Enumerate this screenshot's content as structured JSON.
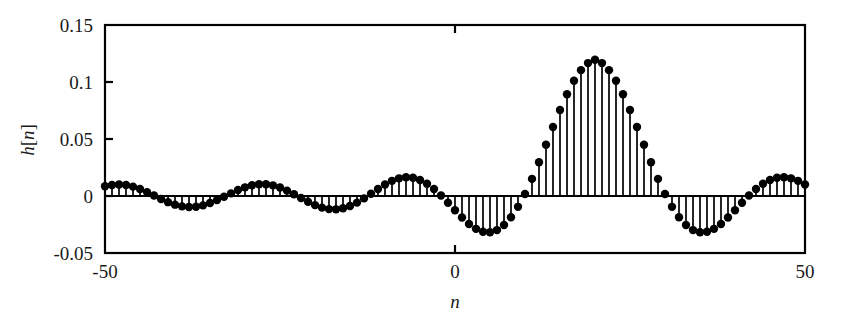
{
  "chart_data": {
    "type": "line",
    "plot_style": "stem",
    "title": "",
    "subtitle": "",
    "xlabel": "n",
    "ylabel": "h[n]",
    "xlim": [
      -50,
      50
    ],
    "ylim": [
      -0.05,
      0.15
    ],
    "xticks": [
      -50,
      0,
      50
    ],
    "xticklabels": [
      "-50",
      "0",
      "50"
    ],
    "yticks": [
      -0.05,
      0,
      0.05,
      0.1,
      0.15
    ],
    "yticklabels": [
      "-0.05",
      "0",
      "0.05",
      "0.1",
      "0.15"
    ],
    "grid": false,
    "legend": false,
    "legend_position": "none",
    "marker": "filled-circle",
    "marker_color": "#000000",
    "stem_color": "#000000",
    "baseline_value": 0,
    "annotations": [],
    "x": [
      -50,
      -49,
      -48,
      -47,
      -46,
      -45,
      -44,
      -43,
      -42,
      -41,
      -40,
      -39,
      -38,
      -37,
      -36,
      -35,
      -34,
      -33,
      -32,
      -31,
      -30,
      -29,
      -28,
      -27,
      -26,
      -25,
      -24,
      -23,
      -22,
      -21,
      -20,
      -19,
      -18,
      -17,
      -16,
      -15,
      -14,
      -13,
      -12,
      -11,
      -10,
      -9,
      -8,
      -7,
      -6,
      -5,
      -4,
      -3,
      -2,
      -1,
      0,
      1,
      2,
      3,
      4,
      5,
      6,
      7,
      8,
      9,
      10,
      11,
      12,
      13,
      14,
      15,
      16,
      17,
      18,
      19,
      20,
      21,
      22,
      23,
      24,
      25,
      26,
      27,
      28,
      29,
      30,
      31,
      32,
      33,
      34,
      35,
      36,
      37,
      38,
      39,
      40,
      41,
      42,
      43,
      44,
      45,
      46,
      47,
      48,
      49,
      50
    ],
    "values": [
      0.0085,
      0.0097,
      0.0101,
      0.0096,
      0.0082,
      0.0061,
      0.0034,
      0.0004,
      -0.0026,
      -0.0054,
      -0.0076,
      -0.0091,
      -0.0097,
      -0.0094,
      -0.0082,
      -0.0062,
      -0.0036,
      -0.0007,
      0.0023,
      0.0052,
      0.0076,
      0.0094,
      0.0103,
      0.0103,
      0.0093,
      0.0074,
      0.0047,
      0.0016,
      -0.0018,
      -0.0051,
      -0.008,
      -0.0102,
      -0.0115,
      -0.0117,
      -0.0108,
      -0.0088,
      -0.0058,
      -0.0021,
      0.002,
      0.0062,
      0.0101,
      0.0133,
      0.0155,
      0.0164,
      0.016,
      0.0141,
      0.0108,
      0.0062,
      0.0005,
      -0.0059,
      -0.0125,
      -0.0189,
      -0.0245,
      -0.0288,
      -0.0313,
      -0.0318,
      -0.0299,
      -0.0255,
      -0.0187,
      -0.0095,
      0.0018,
      0.015,
      0.0296,
      0.045,
      0.0605,
      0.0755,
      0.0893,
      0.1011,
      0.1104,
      0.1166,
      0.1195,
      0.1166,
      0.1104,
      0.1011,
      0.0893,
      0.0755,
      0.0605,
      0.045,
      0.0296,
      0.015,
      0.0018,
      -0.0095,
      -0.0187,
      -0.0255,
      -0.0299,
      -0.0318,
      -0.0313,
      -0.0288,
      -0.0245,
      -0.0189,
      -0.0125,
      -0.0059,
      0.0005,
      0.0062,
      0.0108,
      0.0141,
      0.016,
      0.0164,
      0.0155,
      0.0133,
      0.0101
    ],
    "peak_value": 0.13,
    "peak_x": 0,
    "min_value": -0.0265,
    "n_points": 101
  },
  "axes": {
    "y_label_text": "h",
    "y_label_bracket": "[",
    "y_label_index": "n",
    "y_label_bracket_close": "]"
  }
}
